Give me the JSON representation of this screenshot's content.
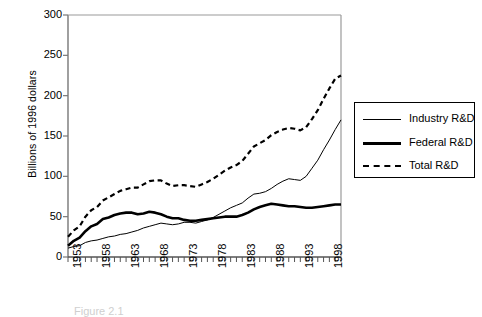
{
  "chart_data": {
    "type": "line",
    "title": "",
    "xlabel": "",
    "ylabel": "Billions of 1996 dollars",
    "ylim": [
      0,
      300
    ],
    "ytick_labels": [
      "0",
      "50",
      "100",
      "150",
      "200",
      "250",
      "300"
    ],
    "ytick_values": [
      0,
      50,
      100,
      150,
      200,
      250,
      300
    ],
    "xlim": [
      1953,
      2000
    ],
    "xtick_labels": [
      "1953",
      "1958",
      "1963",
      "1968",
      "1973",
      "1978",
      "1983",
      "1988",
      "1993",
      "1998"
    ],
    "xtick_values": [
      1953,
      1958,
      1963,
      1968,
      1973,
      1978,
      1983,
      1988,
      1993,
      1998
    ],
    "x": [
      1953,
      1954,
      1955,
      1956,
      1957,
      1958,
      1959,
      1960,
      1961,
      1962,
      1963,
      1964,
      1965,
      1966,
      1967,
      1968,
      1969,
      1970,
      1971,
      1972,
      1973,
      1974,
      1975,
      1976,
      1977,
      1978,
      1979,
      1980,
      1981,
      1982,
      1983,
      1984,
      1985,
      1986,
      1987,
      1988,
      1989,
      1990,
      1991,
      1992,
      1993,
      1994,
      1995,
      1996,
      1997,
      1998,
      1999,
      2000
    ],
    "grid": false,
    "legend_position": "right",
    "series": [
      {
        "name": "Industry R&D",
        "style": "solid-thin",
        "color": "#000000",
        "values": [
          11,
          13,
          14,
          18,
          20,
          21,
          23,
          25,
          26,
          28,
          29,
          31,
          33,
          36,
          38,
          40,
          42,
          41,
          40,
          41,
          43,
          43,
          42,
          44,
          46,
          49,
          53,
          57,
          61,
          64,
          67,
          73,
          78,
          79,
          81,
          85,
          90,
          94,
          97,
          96,
          95,
          100,
          110,
          120,
          133,
          145,
          158,
          170
        ]
      },
      {
        "name": "Federal R&D",
        "style": "solid-thick",
        "color": "#000000",
        "values": [
          14,
          20,
          24,
          32,
          38,
          41,
          47,
          49,
          52,
          54,
          55,
          55,
          53,
          54,
          56,
          55,
          53,
          50,
          48,
          48,
          46,
          45,
          45,
          46,
          47,
          48,
          49,
          50,
          50,
          50,
          52,
          55,
          59,
          62,
          64,
          66,
          65,
          64,
          63,
          63,
          62,
          61,
          61,
          62,
          63,
          64,
          65,
          65
        ]
      },
      {
        "name": "Total R&D",
        "style": "dashed",
        "color": "#000000",
        "values": [
          25,
          33,
          38,
          50,
          58,
          62,
          70,
          74,
          78,
          82,
          84,
          86,
          86,
          90,
          94,
          95,
          95,
          91,
          88,
          89,
          89,
          88,
          87,
          90,
          93,
          97,
          102,
          107,
          111,
          114,
          119,
          128,
          137,
          141,
          145,
          151,
          155,
          158,
          160,
          159,
          157,
          161,
          171,
          182,
          196,
          209,
          221,
          225
        ]
      }
    ]
  },
  "legend": {
    "items": [
      {
        "label": "Industry R&D",
        "style": "solid-thin"
      },
      {
        "label": "Federal R&D",
        "style": "solid-thick"
      },
      {
        "label": "Total R&D",
        "style": "dashed"
      }
    ]
  },
  "caption": {
    "text": "Figure 2.1"
  }
}
